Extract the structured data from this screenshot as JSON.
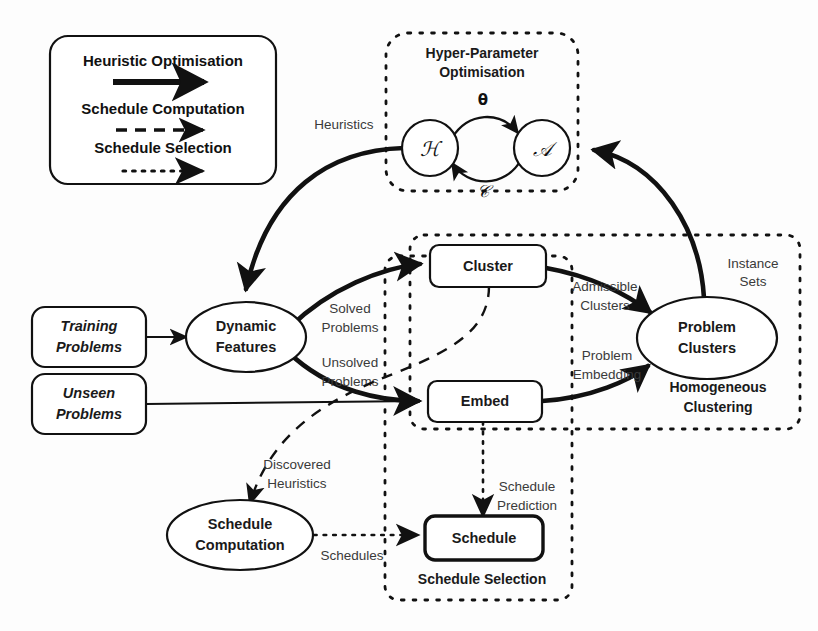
{
  "figure": {
    "background": "#ffffff",
    "ink": "#111111"
  },
  "legend": {
    "entries": [
      {
        "label": "Heuristic Optimisation",
        "style": "solid-thick-arrow"
      },
      {
        "label": "Schedule Computation",
        "style": "dashed-arrow"
      },
      {
        "label": "Schedule Selection",
        "style": "dotted-arrow"
      }
    ]
  },
  "groups": [
    {
      "id": "hpo",
      "title_line1": "Hyper-Parameter",
      "title_line2": "Optimisation"
    },
    {
      "id": "clustering",
      "title_line1": "Homogeneous",
      "title_line2": "Clustering"
    },
    {
      "id": "selection",
      "title_line1": "Schedule Selection",
      "title_line2": ""
    }
  ],
  "nodes": {
    "training_problems": {
      "line1": "Training",
      "line2": "Problems",
      "shape": "rounded-rect",
      "italic": true
    },
    "unseen_problems": {
      "line1": "Unseen",
      "line2": "Problems",
      "shape": "rounded-rect",
      "italic": true
    },
    "dynamic_features": {
      "line1": "Dynamic",
      "line2": "Features",
      "shape": "ellipse",
      "italic": false
    },
    "cluster": {
      "line1": "Cluster",
      "line2": "",
      "shape": "rounded-rect",
      "italic": false
    },
    "embed": {
      "line1": "Embed",
      "line2": "",
      "shape": "rounded-rect",
      "italic": false
    },
    "problem_clusters": {
      "line1": "Problem",
      "line2": "Clusters",
      "shape": "ellipse",
      "italic": false
    },
    "schedule_computation": {
      "line1": "Schedule",
      "line2": "Computation",
      "shape": "ellipse",
      "italic": false
    },
    "schedule": {
      "line1": "Schedule",
      "line2": "",
      "shape": "rounded-rect-bold",
      "italic": false
    },
    "heuristic_space": {
      "symbol": "ℋ",
      "shape": "circle"
    },
    "algorithm_space": {
      "symbol": "𝒜",
      "shape": "circle"
    }
  },
  "edge_labels": {
    "heuristics": "Heuristics",
    "theta": "θ",
    "calligraphic_c": "𝒞",
    "solved_problems_l1": "Solved",
    "solved_problems_l2": "Problems",
    "unsolved_problems_l1": "Unsolved",
    "unsolved_problems_l2": "Problems",
    "admissible_clusters_l1": "Admissible",
    "admissible_clusters_l2": "Clusters",
    "problem_embedding_l1": "Problem",
    "problem_embedding_l2": "Embedding",
    "instance_sets_l1": "Instance",
    "instance_sets_l2": "Sets",
    "discovered_heuristics_l1": "Discovered",
    "discovered_heuristics_l2": "Heuristics",
    "schedule_prediction_l1": "Schedule",
    "schedule_prediction_l2": "Prediction",
    "schedules": "Schedules"
  }
}
